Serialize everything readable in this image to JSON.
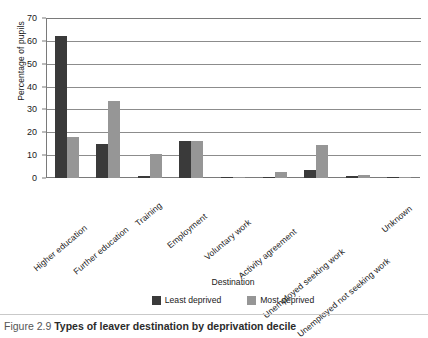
{
  "caption": {
    "number": "Figure 2.9",
    "title": "Types of leaver destination by deprivation decile"
  },
  "legend": {
    "items": [
      {
        "label": "Least deprived",
        "color": "#3a3a3a"
      },
      {
        "label": "Most deprived",
        "color": "#969696"
      }
    ]
  },
  "axes": {
    "ylabel": "Percentage of pupils",
    "xlabel": "Destination",
    "yticks": [
      "0",
      "10",
      "20",
      "30",
      "40",
      "50",
      "60",
      "70"
    ]
  },
  "chart_data": {
    "type": "bar",
    "title": "Types of leaver destination by deprivation decile",
    "xlabel": "Destination",
    "ylabel": "Percentage of pupils",
    "ylim": [
      0,
      70
    ],
    "ytick_step": 10,
    "grid": true,
    "legend_position": "bottom",
    "categories": [
      "Higher education",
      "Further education",
      "Training",
      "Employment",
      "Voluntary work",
      "Activity agreement",
      "Unemployed seeking work",
      "Unemployed not seeking work",
      "Unknown"
    ],
    "series": [
      {
        "name": "Least deprived",
        "color": "#3a3a3a",
        "values": [
          62,
          14.8,
          0.7,
          16,
          0.5,
          0.2,
          3.6,
          0.8,
          0.2
        ]
      },
      {
        "name": "Most deprived",
        "color": "#969696",
        "values": [
          18,
          33.7,
          10.6,
          16.3,
          0.4,
          2.5,
          14.5,
          1.3,
          0.6
        ]
      }
    ]
  }
}
